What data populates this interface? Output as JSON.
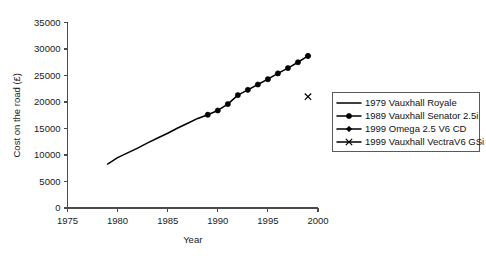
{
  "chart_data": {
    "type": "line",
    "title": "",
    "xlabel": "Year",
    "ylabel": "Cost on the road (£)",
    "xlim": [
      1975,
      2000
    ],
    "ylim": [
      0,
      35000
    ],
    "xticks": [
      1975,
      1980,
      1985,
      1990,
      1995,
      2000
    ],
    "yticks": [
      0,
      5000,
      10000,
      15000,
      20000,
      25000,
      30000,
      35000
    ],
    "grid": false,
    "legend_position": "right",
    "series": [
      {
        "name": "1979 Vauxhall Royale",
        "marker": "none",
        "x": [
          1979,
          1980,
          1981,
          1982,
          1983,
          1984,
          1985,
          1986,
          1987,
          1988,
          1989
        ],
        "values": [
          8300,
          9500,
          10400,
          11300,
          12300,
          13200,
          14100,
          15100,
          16000,
          16900,
          17600
        ]
      },
      {
        "name": "1989 Vauxhall Senator 2.5i",
        "marker": "filled-circle",
        "x": [
          1989,
          1990,
          1991,
          1992,
          1993,
          1994,
          1995,
          1996,
          1997,
          1998,
          1999
        ],
        "values": [
          17600,
          18400,
          19600,
          21300,
          22300,
          23300,
          24300,
          25400,
          26400,
          27500,
          28700
        ]
      },
      {
        "name": "1999 Omega 2.5 V6 CD",
        "marker": "filled-diamond",
        "x": [
          1999
        ],
        "values": [
          28700
        ]
      },
      {
        "name": "1999 Vauxhall VectraV6 GSi",
        "marker": "x-cross",
        "x": [
          1999
        ],
        "values": [
          21000
        ]
      }
    ]
  },
  "axes": {
    "x_tick_labels": [
      "1975",
      "1980",
      "1985",
      "1990",
      "1995",
      "2000"
    ],
    "y_tick_labels": [
      "0",
      "5000",
      "10000",
      "15000",
      "20000",
      "25000",
      "30000",
      "35000"
    ],
    "x_title": "Year",
    "y_title": "Cost on the road (£)"
  },
  "legend": {
    "entries": [
      {
        "label": "1979 Vauxhall Royale",
        "marker": "none"
      },
      {
        "label": "1989 Vauxhall Senator 2.5i",
        "marker": "filled-circle"
      },
      {
        "label": "1999 Omega 2.5 V6 CD",
        "marker": "filled-diamond"
      },
      {
        "label": "1999 Vauxhall VectraV6 GSi",
        "marker": "x-cross"
      }
    ]
  },
  "colors": {
    "series": "#000000",
    "axis": "#4a4a4a",
    "text": "#1a1a1a",
    "background": "#ffffff",
    "legend_border": "#5a5a5a"
  }
}
